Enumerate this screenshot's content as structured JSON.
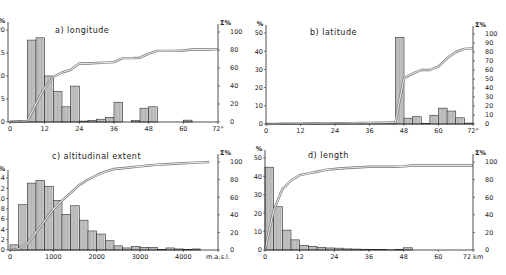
{
  "figure": {
    "background": "#ffffff",
    "ink_color": "#222222",
    "bar_fill": "#d8d8d8",
    "cumulative_line_color": "#9a9a9a"
  },
  "chart_data": [
    {
      "id": "a",
      "type": "bar",
      "title": "a) longitude",
      "xlabel": "",
      "x_unit": "°",
      "ylabel": "%",
      "y2label": "Σ%",
      "x_ticks": [
        "0",
        "12",
        "24",
        "36",
        "48",
        "60",
        "72°"
      ],
      "xlim": [
        0,
        72
      ],
      "ylim": [
        0,
        20
      ],
      "y_ticks": [
        "0",
        "5",
        "10",
        "15",
        "20"
      ],
      "y2lim": [
        0,
        100
      ],
      "y2_ticks": [
        "0",
        "20",
        "40",
        "60",
        "80",
        "100"
      ],
      "bin_width": 3,
      "bins_start": [
        0,
        3,
        6,
        9,
        12,
        15,
        18,
        21,
        24,
        27,
        30,
        33,
        36,
        39,
        42,
        45,
        48,
        51,
        54,
        57,
        60,
        63,
        66,
        69
      ],
      "series": [
        {
          "name": "frequency %",
          "values": [
            0.2,
            0.3,
            17.8,
            18.3,
            10.0,
            6.6,
            3.3,
            7.8,
            0.2,
            0.3,
            0.6,
            1.0,
            4.3,
            0,
            0.3,
            3.0,
            3.3,
            0,
            0,
            0,
            0.4,
            0,
            0,
            0
          ]
        },
        {
          "name": "cumulative Σ%",
          "values": [
            0.5,
            1,
            20,
            38,
            50,
            55,
            58,
            65,
            65,
            65.5,
            66,
            66.5,
            71,
            71,
            71.5,
            76,
            79,
            79,
            79,
            79.5,
            80.5,
            80.5,
            80.5,
            81
          ]
        }
      ],
      "grid": false
    },
    {
      "id": "b",
      "type": "bar",
      "title": "b) latitude",
      "xlabel": "",
      "x_unit": "°",
      "ylabel": "%",
      "y2label": "Σ%",
      "x_ticks": [
        "0",
        "12",
        "24",
        "36",
        "48",
        "60",
        "72°"
      ],
      "xlim": [
        0,
        72
      ],
      "ylim": [
        0,
        50
      ],
      "y_ticks": [
        "0",
        "10",
        "20",
        "30",
        "40",
        "50"
      ],
      "y2lim": [
        0,
        100
      ],
      "y2_ticks": [
        "0",
        "10",
        "20",
        "30",
        "40",
        "50",
        "60",
        "70",
        "80",
        "90",
        "100"
      ],
      "bin_width": 3,
      "bins_start": [
        0,
        3,
        6,
        9,
        12,
        15,
        18,
        21,
        24,
        27,
        30,
        33,
        36,
        39,
        42,
        45,
        48,
        51,
        54,
        57,
        60,
        63,
        66,
        69
      ],
      "series": [
        {
          "name": "frequency %",
          "values": [
            0.1,
            0.1,
            0.1,
            0.1,
            0.1,
            0.1,
            0.1,
            0.1,
            0.1,
            0.1,
            0.1,
            0.1,
            0.1,
            0.1,
            0.3,
            47.5,
            3.2,
            4.0,
            0.3,
            4.8,
            8.7,
            7.1,
            3.4,
            0.5
          ]
        },
        {
          "name": "cumulative Σ%",
          "values": [
            0.1,
            0.2,
            0.3,
            0.4,
            0.5,
            0.6,
            0.7,
            0.8,
            0.9,
            1.0,
            1.1,
            1.2,
            1.3,
            1.4,
            2,
            51,
            56,
            60,
            60,
            64,
            73,
            80,
            83.5,
            84
          ]
        }
      ],
      "grid": false
    },
    {
      "id": "c",
      "type": "bar",
      "title": "c) altitudinal extent",
      "xlabel": "m.a.s.l.",
      "ylabel": "%",
      "y2label": "Σ%",
      "x_ticks": [
        "0",
        "1000",
        "2000",
        "3000",
        "4000",
        "m.a.s.l."
      ],
      "xlim": [
        0,
        4800
      ],
      "ylim": [
        0,
        14
      ],
      "y_ticks": [
        "0",
        "2",
        "4",
        "6",
        "8",
        "10",
        "12",
        "14"
      ],
      "y2lim": [
        0,
        100
      ],
      "y2_ticks": [
        "0",
        "20",
        "40",
        "60",
        "80",
        "100"
      ],
      "bin_width": 200,
      "bins_start": [
        0,
        200,
        400,
        600,
        800,
        1000,
        1200,
        1400,
        1600,
        1800,
        2000,
        2200,
        2400,
        2600,
        2800,
        3000,
        3200,
        3400,
        3600,
        3800,
        4000,
        4200,
        4400
      ],
      "series": [
        {
          "name": "frequency %",
          "values": [
            1.0,
            8.8,
            13.0,
            13.5,
            12.4,
            9.6,
            6.9,
            8.6,
            5.8,
            3.7,
            3.1,
            1.8,
            0.8,
            0.4,
            0.7,
            0.5,
            0.5,
            0.1,
            0.4,
            0.2,
            0.1,
            0.2,
            0
          ]
        },
        {
          "name": "cumulative Σ%",
          "values": [
            1,
            7,
            20,
            33,
            46,
            56,
            65,
            74,
            80,
            85,
            89,
            92,
            93,
            94,
            95,
            96,
            97,
            97.5,
            98,
            98.5,
            99,
            99.5,
            100
          ]
        }
      ],
      "grid": false
    },
    {
      "id": "d",
      "type": "bar",
      "title": "d) length",
      "xlabel": "km",
      "ylabel": "%",
      "y2label": "Σ%",
      "x_ticks": [
        "0",
        "12",
        "24",
        "36",
        "48",
        "60",
        "72 km"
      ],
      "xlim": [
        0,
        72
      ],
      "ylim": [
        0,
        50
      ],
      "y_ticks": [
        "0",
        "10",
        "20",
        "30",
        "40",
        "50"
      ],
      "y2lim": [
        0,
        100
      ],
      "y2_ticks": [
        "0",
        "20",
        "40",
        "60",
        "80",
        "100"
      ],
      "bin_width": 3,
      "bins_start": [
        0,
        3,
        6,
        9,
        12,
        15,
        18,
        21,
        24,
        27,
        30,
        33,
        36,
        39,
        42,
        45,
        48,
        51,
        54,
        57,
        60,
        63,
        66,
        69
      ],
      "series": [
        {
          "name": "frequency %",
          "values": [
            45,
            23.5,
            10.8,
            5.5,
            2.4,
            2.0,
            1.4,
            1.1,
            1.0,
            0.6,
            0.5,
            0.4,
            0.3,
            0.3,
            0.1,
            0.3,
            1.2,
            0,
            0,
            0,
            0,
            0,
            0,
            0
          ]
        },
        {
          "name": "cumulative Σ%",
          "values": [
            45,
            69,
            79,
            85,
            87,
            89,
            91,
            92,
            93,
            93.5,
            94,
            94.5,
            94.5,
            94.5,
            94.5,
            95,
            96,
            96,
            96,
            96,
            96,
            96,
            96,
            96
          ]
        }
      ],
      "grid": false
    }
  ],
  "panels": [
    {
      "title": "a) longitude",
      "y_unit": "%",
      "y2_unit": "Σ%",
      "x_end_label": "72°"
    },
    {
      "title": "b) latitude",
      "y_unit": "%",
      "y2_unit": "Σ%",
      "x_end_label": "72°"
    },
    {
      "title": "c) altitudinal extent",
      "y_unit": "%",
      "y2_unit": "Σ%",
      "x_end_label": "m.a.s.l."
    },
    {
      "title": "d) length",
      "y_unit": "%",
      "y2_unit": "Σ%",
      "x_end_label": "72 km"
    }
  ]
}
